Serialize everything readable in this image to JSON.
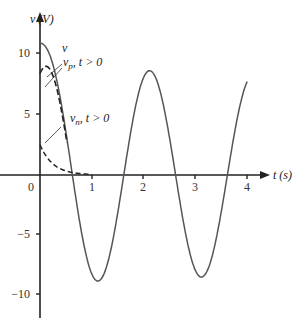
{
  "chart_data": {
    "type": "line",
    "title": "",
    "xlabel": "t (s)",
    "ylabel": "v (V)",
    "xlim": [
      0,
      4
    ],
    "ylim": [
      -12,
      12
    ],
    "grid": false,
    "x_ticks": [
      "0",
      "1",
      "2",
      "3",
      "4"
    ],
    "y_ticks": [
      "10",
      "5",
      "−5",
      "−10"
    ],
    "series": [
      {
        "name": "v",
        "style": "solid",
        "x": [
          0,
          0.25,
          0.5,
          0.75,
          1.0,
          1.5,
          2.0,
          2.5,
          3.0,
          3.5,
          4.0
        ],
        "values": [
          10.7,
          7.3,
          0.5,
          -6.0,
          -9.1,
          0.0,
          9.2,
          0.0,
          -8.5,
          0.0,
          8.5
        ]
      },
      {
        "name": "v_p, t > 0",
        "style": "dashed",
        "x": [
          0,
          0.1,
          0.2,
          0.3,
          0.4,
          0.5
        ],
        "values": [
          8.4,
          7.6,
          6.2,
          4.4,
          2.3,
          0.3
        ]
      },
      {
        "name": "v_n, t > 0",
        "style": "dashed",
        "x": [
          0,
          0.2,
          0.4,
          0.6,
          0.8,
          1.0
        ],
        "values": [
          2.5,
          1.4,
          0.6,
          0.3,
          0.1,
          0.0
        ]
      }
    ],
    "annotations": [
      {
        "text": "v",
        "target": "v"
      },
      {
        "text": "v_p , t > 0",
        "target": "v_p"
      },
      {
        "text": "v_n , t > 0",
        "target": "v_n"
      }
    ]
  },
  "labels": {
    "yaxis": "v (V)",
    "xaxis": "t (s)",
    "ann_v": "v",
    "ann_vp_main": "v",
    "ann_vp_sub": "p",
    "ann_vp_tail": ", t > 0",
    "ann_vn_main": "v",
    "ann_vn_sub": "n",
    "ann_vn_tail": ", t > 0",
    "origin": "0",
    "x1": "1",
    "x2": "2",
    "x3": "3",
    "x4": "4",
    "y10": "10",
    "y5": "5",
    "ym5": "−5",
    "ym10": "−10"
  }
}
